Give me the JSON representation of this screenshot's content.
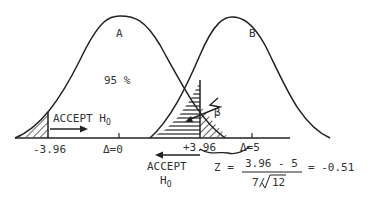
{
  "diagram": {
    "curves": [
      {
        "id": "A",
        "label": "A",
        "center_label": "Δ=0"
      },
      {
        "id": "B",
        "label": "B",
        "center_label": "Δ=5"
      }
    ],
    "area_label": "95 %",
    "beta_label": "β",
    "left_cut": "-3.96",
    "right_cut": "+3.96",
    "accept_left": {
      "text": "ACCEPT H",
      "sub": "O"
    },
    "accept_right": {
      "line1": "ACCEPT",
      "line2": "H",
      "sub": "O"
    },
    "formula": {
      "lhs": "Z =",
      "numerator": "3.96 - 5",
      "denominator_prefix": "7/",
      "denominator_root": "12",
      "result": "= -0.51"
    },
    "colors": {
      "ink": "#222222",
      "background": "#ffffff"
    }
  }
}
